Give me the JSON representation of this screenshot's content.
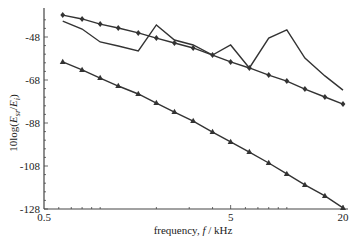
{
  "chart_data": {
    "type": "line",
    "title": "",
    "xlabel": "frequency, f / kHz",
    "ylabel": "10log(E_sr/E_i)",
    "xscale": "log",
    "xlim": [
      0.5,
      20
    ],
    "ylim": [
      -128,
      -38
    ],
    "xticks": [
      0.5,
      5,
      20
    ],
    "xtick_labels": [
      "0.5",
      "5",
      "20"
    ],
    "yticks": [
      -48,
      -68,
      -88,
      -108,
      -128
    ],
    "ytick_labels": [
      "-48",
      "-68",
      "-88",
      "-108",
      "-128"
    ],
    "grid": false,
    "legend": null,
    "x": [
      0.63,
      0.8,
      1.0,
      1.25,
      1.6,
      2.0,
      2.5,
      3.15,
      4.0,
      5.0,
      6.3,
      8.0,
      10.0,
      12.5,
      16.0,
      20.0
    ],
    "series": [
      {
        "name": "diamond-marked series",
        "marker": "diamond",
        "values": [
          -37.8,
          -39.6,
          -42.0,
          -43.8,
          -46.1,
          -48.5,
          -50.8,
          -53.1,
          -56.4,
          -59.6,
          -62.4,
          -65.7,
          -68.5,
          -72.2,
          -75.9,
          -79.2
        ]
      },
      {
        "name": "unmarked series",
        "marker": "none",
        "values": [
          -40.6,
          -44.3,
          -50.3,
          -52.2,
          -54.5,
          -42.4,
          -49.4,
          -51.7,
          -56.4,
          -51.7,
          -62.4,
          -48.5,
          -44.7,
          -57.8,
          -66.1,
          -72.7
        ]
      },
      {
        "name": "triangle-marked series",
        "marker": "triangle",
        "values": [
          -59.6,
          -63.3,
          -67.1,
          -70.8,
          -74.5,
          -78.7,
          -82.9,
          -87.1,
          -92.2,
          -96.8,
          -101.5,
          -106.6,
          -111.7,
          -116.8,
          -121.9,
          -127.5
        ]
      }
    ]
  },
  "labels": {
    "xlabel_prefix": "frequency, ",
    "xlabel_var": "f",
    "xlabel_suffix": " / kHz",
    "ylabel_prefix": "10log(",
    "ylabel_num": "E",
    "ylabel_num_sub": "sr",
    "ylabel_slash": "/",
    "ylabel_den": "E",
    "ylabel_den_sub": "i",
    "ylabel_close": ")"
  },
  "colors": {
    "line": "#333333",
    "axis": "#444444"
  }
}
